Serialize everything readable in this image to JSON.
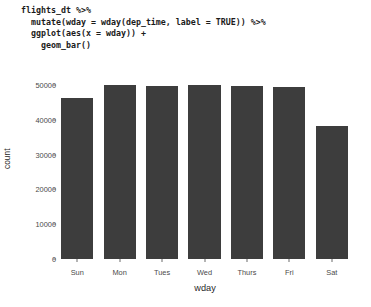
{
  "code": {
    "lines": [
      "flights_dt %>%",
      "  mutate(wday = wday(dep_time, label = TRUE)) %>%",
      "  ggplot(aes(x = wday)) +",
      "    geom_bar()"
    ]
  },
  "chart_data": {
    "type": "bar",
    "title": "",
    "xlabel": "wday",
    "ylabel": "count",
    "categories": [
      "Sun",
      "Mon",
      "Tues",
      "Wed",
      "Thurs",
      "Fri",
      "Sat"
    ],
    "values": [
      46200,
      49900,
      49600,
      49900,
      49600,
      49300,
      38100
    ],
    "ylim": [
      0,
      52000
    ],
    "yticks": [
      0,
      10000,
      20000,
      30000,
      40000,
      50000
    ],
    "ytick_labels": [
      "0",
      "10000",
      "20000",
      "30000",
      "40000",
      "50000"
    ],
    "grid": false,
    "legend": "none",
    "bar_color": "#3d3d3d",
    "background": "#ffffff"
  }
}
